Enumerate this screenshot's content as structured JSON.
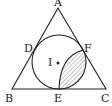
{
  "diagram": {
    "type": "geometry",
    "labels": {
      "A": "A",
      "B": "B",
      "C": "C",
      "D": "D",
      "E": "E",
      "F": "F",
      "I": "I"
    },
    "colors": {
      "stroke": "#222222",
      "hatch": "#555555",
      "background": "#ffffff"
    }
  }
}
